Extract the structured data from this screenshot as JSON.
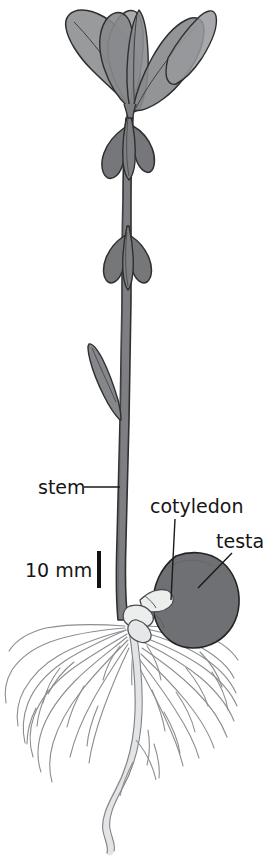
{
  "figure": {
    "background_color": "#ffffff"
  },
  "labels": {
    "stem": "stem",
    "cotyledon": "cotyledon",
    "testa": "testa"
  },
  "scale": {
    "value": "10 mm"
  },
  "colors": {
    "stem_fill": "#7d7f82",
    "leaf_fill": "#8c8e91",
    "leaf_fill_light": "#9a9c9f",
    "testa_fill": "#6e7073",
    "root_fill": "#e8e9ea",
    "outline": "#2a2a2a",
    "root_outline": "#8b8d90",
    "text": "#151515"
  },
  "parts": [
    {
      "name": "leaves",
      "label": "cotyledonary leaves"
    },
    {
      "name": "upper-stem-bracts",
      "label": "bracts"
    },
    {
      "name": "stem",
      "label": "stem"
    },
    {
      "name": "lower-leaf",
      "label": "leaf sheath"
    },
    {
      "name": "cotyledon",
      "label": "cotyledon"
    },
    {
      "name": "testa",
      "label": "testa"
    },
    {
      "name": "taproot",
      "label": "taproot"
    },
    {
      "name": "lateral-roots",
      "label": "lateral roots"
    }
  ]
}
